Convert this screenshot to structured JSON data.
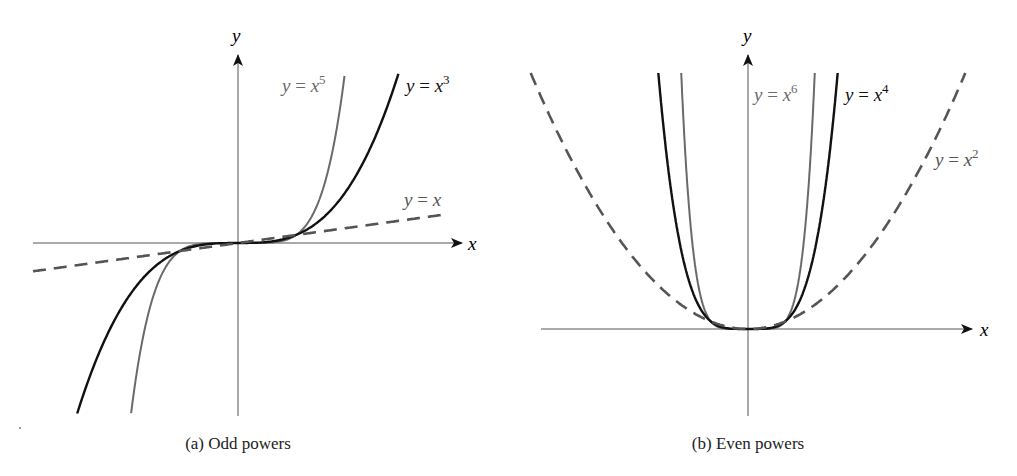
{
  "chart_data": [
    {
      "type": "line",
      "title": "(a) Odd powers",
      "xlabel": "x",
      "ylabel": "y",
      "grid": false,
      "legend": "inline labels near curve ends",
      "series": [
        {
          "name": "y = x^5",
          "exponent": 5,
          "style": "solid",
          "color": "#6a6a6a",
          "label_text": "y = x",
          "label_sup": "5"
        },
        {
          "name": "y = x^3",
          "exponent": 3,
          "style": "solid",
          "color": "#111111",
          "label_text": "y = x",
          "label_sup": "3"
        },
        {
          "name": "y = x",
          "exponent": 1,
          "style": "dashed",
          "color": "#555555",
          "label_text": "y = x",
          "label_sup": ""
        }
      ],
      "xlim": [
        -3.6,
        3.8
      ],
      "ylim": [
        -21.5,
        21.5
      ],
      "intersections": [
        [
          -1,
          -1
        ],
        [
          0,
          0
        ],
        [
          1,
          1
        ]
      ],
      "render": {
        "origin": [
          238,
          243
        ],
        "sx": 58,
        "sy": 8.0,
        "x_axis": [
          33,
          462
        ],
        "y_axis": [
          416,
          55
        ],
        "clip_top": 72,
        "clip_bottom": 416,
        "dashed_start_x": 33,
        "dashed_end_x": 445
      }
    },
    {
      "type": "line",
      "title": "(b) Even powers",
      "xlabel": "x",
      "ylabel": "y",
      "grid": false,
      "legend": "inline labels near curve ends",
      "series": [
        {
          "name": "y = x^6",
          "exponent": 6,
          "style": "solid",
          "color": "#6a6a6a",
          "label_text": "y = x",
          "label_sup": "6"
        },
        {
          "name": "y = x^4",
          "exponent": 4,
          "style": "solid",
          "color": "#111111",
          "label_text": "y = x",
          "label_sup": "4"
        },
        {
          "name": "y = x^2",
          "exponent": 2,
          "style": "dashed",
          "color": "#555555",
          "label_text": "y = x",
          "label_sup": "2"
        }
      ],
      "xlim": [
        -5.8,
        6.0
      ],
      "ylim": [
        -12,
        34.5
      ],
      "intersections": [
        [
          -1,
          1
        ],
        [
          0,
          0
        ],
        [
          1,
          1
        ]
      ],
      "render": {
        "origin": [
          748,
          329
        ],
        "sx": 37,
        "sy": 7.42,
        "x_axis": [
          541,
          972
        ],
        "y_axis": [
          416,
          55
        ],
        "clip_top": 73
      }
    }
  ],
  "figure": {
    "axis_x_label": "x",
    "axis_y_label": "y",
    "panel_a_caption": "(a) Odd powers",
    "panel_b_caption": "(b) Even powers"
  }
}
